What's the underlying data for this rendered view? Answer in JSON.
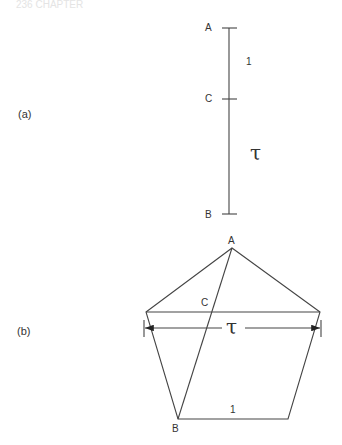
{
  "header": {
    "faded_text": "236   CHAPTER"
  },
  "part_a": {
    "label": "(a)",
    "points": {
      "A": {
        "label": "A"
      },
      "C": {
        "label": "C"
      },
      "B": {
        "label": "B"
      }
    },
    "segments": {
      "AC": {
        "length_label": "1"
      },
      "CB": {
        "length_label": "τ"
      }
    }
  },
  "part_b": {
    "label": "(b)",
    "vertices": {
      "A": {
        "label": "A"
      },
      "B": {
        "label": "B"
      }
    },
    "intersection": {
      "label": "C"
    },
    "diagonal_dimension": {
      "label": "τ"
    },
    "side": {
      "label": "1"
    }
  },
  "colors": {
    "line": "#444444",
    "text": "#333333",
    "background": "#ffffff"
  }
}
